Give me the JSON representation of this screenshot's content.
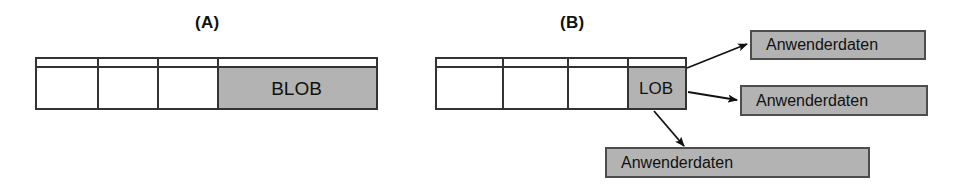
{
  "figure": {
    "width": 963,
    "height": 187,
    "background": "#ffffff",
    "ink_color": "#111111",
    "fill_gray": "#b3b3b3",
    "border_color": "#333333"
  },
  "panels": [
    {
      "id": "panel-a",
      "label": "(A)",
      "label_x": 195,
      "label_y": 14,
      "record": {
        "x": 35,
        "y": 57,
        "width": 343,
        "height": 53,
        "header_height": 9,
        "dividers": [
          60,
          120,
          180
        ],
        "cells": [
          {
            "label": "",
            "filled": false
          },
          {
            "label": "",
            "filled": false
          },
          {
            "label": "",
            "filled": false
          },
          {
            "label": "BLOB",
            "filled": true
          }
        ],
        "lob_cell_x": 180,
        "lob_cell_width": 163
      }
    },
    {
      "id": "panel-b",
      "label": "(B)",
      "label_x": 560,
      "label_y": 14,
      "record": {
        "x": 435,
        "y": 57,
        "width": 252,
        "height": 53,
        "header_height": 9,
        "dividers": [
          65,
          130,
          190
        ],
        "cells": [
          {
            "label": "",
            "filled": false
          },
          {
            "label": "",
            "filled": false
          },
          {
            "label": "",
            "filled": false
          },
          {
            "label": "LOB",
            "filled": true
          }
        ],
        "lob_cell_x": 190,
        "lob_cell_width": 62
      },
      "data_boxes": [
        {
          "id": "anwenderdaten-1",
          "label": "Anwenderdaten",
          "x": 750,
          "y": 30,
          "width": 176,
          "height": 30
        },
        {
          "id": "anwenderdaten-2",
          "label": "Anwenderdaten",
          "x": 740,
          "y": 85,
          "width": 188,
          "height": 31
        },
        {
          "id": "anwenderdaten-3",
          "label": "Anwenderdaten",
          "x": 605,
          "y": 147,
          "width": 265,
          "height": 31
        }
      ],
      "arrows": [
        {
          "id": "arrow-to-anwenderdaten-1",
          "x1": 687,
          "y1": 68,
          "x2": 747,
          "y2": 44
        },
        {
          "id": "arrow-to-anwenderdaten-2",
          "x1": 688,
          "y1": 92,
          "x2": 737,
          "y2": 100
        },
        {
          "id": "arrow-to-anwenderdaten-3",
          "x1": 654,
          "y1": 111,
          "x2": 684,
          "y2": 146
        }
      ]
    }
  ]
}
